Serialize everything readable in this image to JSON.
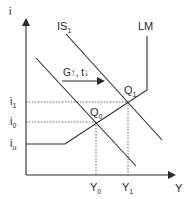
{
  "axes": {
    "y_label": "i",
    "x_label": "Y"
  },
  "curves": {
    "is1_label": "IS",
    "is1_sub": "1",
    "lm_label": "LM"
  },
  "shift": {
    "label": "G↑, t↓"
  },
  "points": {
    "q1_label": "Q",
    "q1_sub": "1",
    "q0_label": "Q",
    "q0_sub": "0"
  },
  "y_ticks": {
    "i1_label": "i",
    "i1_sub": "1",
    "i0_label": "i",
    "i0_sub": "0",
    "iu_label": "i",
    "iu_sub": "u"
  },
  "x_ticks": {
    "y0_label": "Y",
    "y0_sub": "0",
    "y1_label": "Y",
    "y1_sub": "1"
  },
  "colors": {
    "line": "#2a2a2a",
    "background": "#ffffff"
  }
}
